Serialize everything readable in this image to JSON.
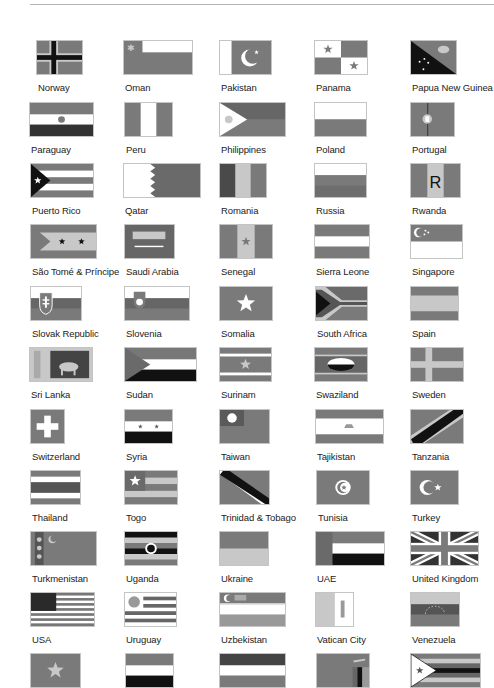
{
  "page": {
    "colors": {
      "mid": "#7a7a7a",
      "light": "#c8c8c8",
      "white": "#ffffff",
      "dark": "#111111",
      "text": "#222222",
      "rule": "#b4b4b4"
    },
    "layout": {
      "row_tops": [
        40,
        102,
        163,
        224,
        286,
        347,
        409,
        470,
        531,
        592,
        653
      ],
      "flag_height": 35,
      "label_offset": 42
    }
  },
  "flags": [
    {
      "name": "Norway",
      "row": 0,
      "x": 36,
      "w": 47,
      "design": "nordic-cross-dark"
    },
    {
      "name": "Oman",
      "row": 0,
      "x": 123,
      "w": 70,
      "design": "oman"
    },
    {
      "name": "Pakistan",
      "row": 0,
      "x": 219,
      "w": 53,
      "design": "pakistan"
    },
    {
      "name": "Panama",
      "row": 0,
      "x": 314,
      "w": 54,
      "design": "panama"
    },
    {
      "name": "Papua New Guinea",
      "row": 0,
      "x": 410,
      "w": 47,
      "design": "png"
    },
    {
      "name": "Paraguay",
      "row": 1,
      "x": 29,
      "w": 65,
      "design": "tri-h-mid-white-dark-emblem"
    },
    {
      "name": "Peru",
      "row": 1,
      "x": 124,
      "w": 49,
      "design": "tri-v-mid-white-mid"
    },
    {
      "name": "Philippines",
      "row": 1,
      "x": 219,
      "w": 67,
      "design": "philippines"
    },
    {
      "name": "Poland",
      "row": 1,
      "x": 314,
      "w": 53,
      "design": "bi-h-white-mid"
    },
    {
      "name": "Portugal",
      "row": 1,
      "x": 410,
      "w": 45,
      "design": "portugal"
    },
    {
      "name": "Puerto Rico",
      "row": 2,
      "x": 30,
      "w": 64,
      "design": "puerto-rico"
    },
    {
      "name": "Qatar",
      "row": 2,
      "x": 123,
      "w": 78,
      "design": "qatar"
    },
    {
      "name": "Romania",
      "row": 2,
      "x": 219,
      "w": 48,
      "design": "tri-v-dark-light-mid"
    },
    {
      "name": "Russia",
      "row": 2,
      "x": 314,
      "w": 53,
      "design": "tri-h-white-mid-mid"
    },
    {
      "name": "Rwanda",
      "row": 2,
      "x": 410,
      "w": 51,
      "design": "rwanda"
    },
    {
      "name": "São Tomé & Príncipe",
      "row": 3,
      "x": 30,
      "w": 67,
      "design": "sao-tome"
    },
    {
      "name": "Saudi Arabia",
      "row": 3,
      "x": 124,
      "w": 51,
      "design": "saudi"
    },
    {
      "name": "Senegal",
      "row": 3,
      "x": 219,
      "w": 54,
      "design": "senegal"
    },
    {
      "name": "Sierra Leone",
      "row": 3,
      "x": 314,
      "w": 56,
      "design": "tri-h-mid-white-mid"
    },
    {
      "name": "Singapore",
      "row": 3,
      "x": 410,
      "w": 53,
      "design": "singapore"
    },
    {
      "name": "Slovak Republic",
      "row": 4,
      "x": 30,
      "w": 52,
      "design": "slovakia"
    },
    {
      "name": "Slovenia",
      "row": 4,
      "x": 124,
      "w": 66,
      "design": "slovenia"
    },
    {
      "name": "Somalia",
      "row": 4,
      "x": 219,
      "w": 54,
      "design": "somalia"
    },
    {
      "name": "South Africa",
      "row": 4,
      "x": 315,
      "w": 53,
      "design": "south-africa"
    },
    {
      "name": "Spain",
      "row": 4,
      "x": 410,
      "w": 49,
      "design": "spain"
    },
    {
      "name": "Sri Lanka",
      "row": 5,
      "x": 29,
      "w": 64,
      "design": "sri-lanka"
    },
    {
      "name": "Sudan",
      "row": 5,
      "x": 124,
      "w": 73,
      "design": "sudan"
    },
    {
      "name": "Surinam",
      "row": 5,
      "x": 219,
      "w": 53,
      "design": "surinam"
    },
    {
      "name": "Swaziland",
      "row": 5,
      "x": 314,
      "w": 54,
      "design": "swaziland"
    },
    {
      "name": "Sweden",
      "row": 5,
      "x": 410,
      "w": 54,
      "design": "nordic-cross-light"
    },
    {
      "name": "Switzerland",
      "row": 6,
      "x": 30,
      "w": 35,
      "design": "switzerland"
    },
    {
      "name": "Syria",
      "row": 6,
      "x": 124,
      "w": 49,
      "design": "syria"
    },
    {
      "name": "Taiwan",
      "row": 6,
      "x": 219,
      "w": 51,
      "design": "taiwan"
    },
    {
      "name": "Tajikistan",
      "row": 6,
      "x": 315,
      "w": 69,
      "design": "tajikistan"
    },
    {
      "name": "Tanzania",
      "row": 6,
      "x": 410,
      "w": 54,
      "design": "tanzania"
    },
    {
      "name": "Thailand",
      "row": 7,
      "x": 30,
      "w": 51,
      "design": "thailand"
    },
    {
      "name": "Togo",
      "row": 7,
      "x": 124,
      "w": 54,
      "design": "togo"
    },
    {
      "name": "Trinidad & Tobago",
      "row": 7,
      "x": 219,
      "w": 51,
      "design": "trinidad"
    },
    {
      "name": "Tunisia",
      "row": 7,
      "x": 316,
      "w": 54,
      "design": "tunisia"
    },
    {
      "name": "Turkey",
      "row": 7,
      "x": 410,
      "w": 49,
      "design": "turkey"
    },
    {
      "name": "Turkmenistan",
      "row": 8,
      "x": 30,
      "w": 67,
      "design": "turkmenistan"
    },
    {
      "name": "Uganda",
      "row": 8,
      "x": 124,
      "w": 54,
      "design": "uganda"
    },
    {
      "name": "Ukraine",
      "row": 8,
      "x": 219,
      "w": 50,
      "design": "bi-h-mid-light"
    },
    {
      "name": "UAE",
      "row": 8,
      "x": 315,
      "w": 70,
      "design": "uae"
    },
    {
      "name": "United Kingdom",
      "row": 8,
      "x": 410,
      "w": 69,
      "design": "uk"
    },
    {
      "name": "USA",
      "row": 9,
      "x": 30,
      "w": 65,
      "design": "usa"
    },
    {
      "name": "Uruguay",
      "row": 9,
      "x": 124,
      "w": 53,
      "design": "uruguay"
    },
    {
      "name": "Uzbekistan",
      "row": 9,
      "x": 219,
      "w": 67,
      "design": "uzbekistan"
    },
    {
      "name": "Vatican City",
      "row": 9,
      "x": 315,
      "w": 39,
      "design": "vatican"
    },
    {
      "name": "Venezuela",
      "row": 9,
      "x": 410,
      "w": 50,
      "design": "venezuela"
    },
    {
      "name": "",
      "row": 10,
      "x": 30,
      "w": 51,
      "design": "vietnam"
    },
    {
      "name": "",
      "row": 10,
      "x": 125,
      "w": 49,
      "design": "yemen"
    },
    {
      "name": "",
      "row": 10,
      "x": 219,
      "w": 67,
      "design": "yugoslavia"
    },
    {
      "name": "",
      "row": 10,
      "x": 316,
      "w": 54,
      "design": "zambia"
    },
    {
      "name": "",
      "row": 10,
      "x": 410,
      "w": 71,
      "design": "zimbabwe"
    }
  ]
}
